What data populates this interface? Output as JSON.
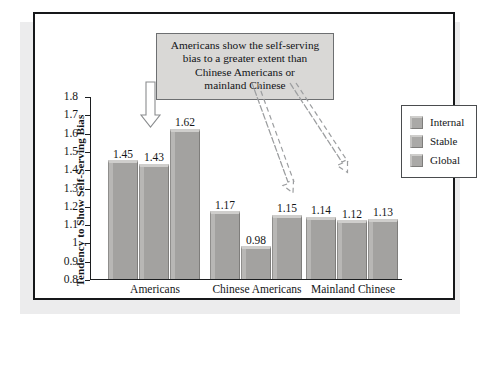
{
  "chart_data": {
    "type": "bar",
    "title": "",
    "xlabel": "",
    "ylabel": "Tendency to Show Self-Serving Bias",
    "ylim": [
      0.8,
      1.8
    ],
    "ytick_labels": [
      "1.8",
      "1.7",
      "1.6",
      "1.5",
      "1.4",
      "1.3",
      "1.2",
      "1.1",
      "1",
      "0.9",
      "0.8"
    ],
    "yticks": [
      1.8,
      1.7,
      1.6,
      1.5,
      1.4,
      1.3,
      1.2,
      1.1,
      1.0,
      0.9,
      0.8
    ],
    "grid": false,
    "legend_position": "upper-right",
    "categories": [
      "Americans",
      "Chinese Americans",
      "Mainland Chinese"
    ],
    "series": [
      {
        "name": "Internal",
        "values": [
          1.45,
          1.17,
          1.14
        ],
        "labels": [
          "1.45",
          "1.17",
          "1.14"
        ]
      },
      {
        "name": "Stable",
        "values": [
          1.43,
          0.98,
          1.12
        ],
        "labels": [
          "1.43",
          "0.98",
          "1.12"
        ]
      },
      {
        "name": "Global",
        "values": [
          1.62,
          1.15,
          1.13
        ],
        "labels": [
          "1.62",
          "1.15",
          "1.13"
        ]
      }
    ],
    "annotations": [
      {
        "id": "callout",
        "text": "Americans show the self-serving bias to a greater extent than Chinese Americans or mainland Chinese",
        "lines": [
          "Americans show the self-serving",
          "bias to a greater extent than",
          "Chinese Americans or",
          "mainland Chinese"
        ],
        "arrows": [
          "down-to-americans",
          "diagonal-to-chinese-americans",
          "diagonal-to-mainland-chinese"
        ]
      }
    ],
    "colors": {
      "bar_face": "#a3a2a0",
      "bar_highlight": "#cfcecc",
      "bar_shadow": "#7e7d7b",
      "callout_fill": "#d9d8d6",
      "frame": "#16181a",
      "text": "#141618"
    }
  }
}
